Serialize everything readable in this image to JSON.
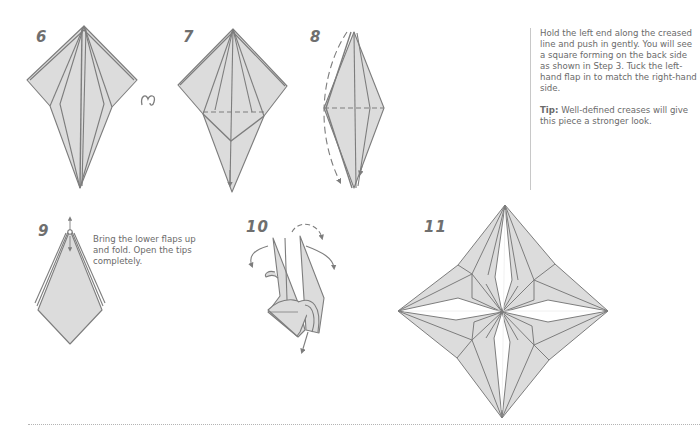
{
  "colors": {
    "paper_fill": "#dcdcdc",
    "line": "#7d7d7d",
    "text": "#6a6a6a",
    "step_number": "#6f6f6f",
    "divider": "#c8c8c8",
    "footer_dots": "#b4b4b4"
  },
  "steps": [
    {
      "number": "6",
      "icon": "turn-over-icon"
    },
    {
      "number": "7"
    },
    {
      "number": "8"
    },
    {
      "number": "9",
      "caption": "Bring the lower flaps up and fold. Open the tips completely."
    },
    {
      "number": "10"
    },
    {
      "number": "11"
    }
  ],
  "instructions": {
    "main": "Hold the left end along the creased line and push in gently. You will see a square forming on the back side as shown in Step 3. Tuck the left-hand flap in to match the right-hand side.",
    "tip_label": "Tip:",
    "tip_text": " Well-defined creases will give this piece a stronger look."
  }
}
